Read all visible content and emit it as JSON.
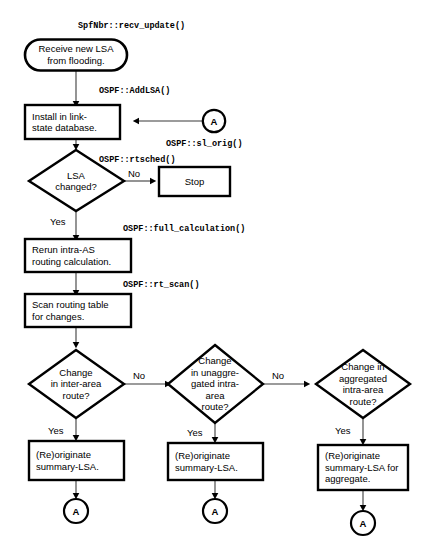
{
  "diagram": {
    "colors": {
      "shape_stroke": "#000000",
      "shape_fill": "#ffffff",
      "connector_line": "#7a7a7a",
      "arrowhead": "#000000",
      "text": "#000000",
      "background": "#ffffff"
    },
    "nodes": {
      "receive_lsa": {
        "shape": "terminator",
        "label": "Receive new LSA\nfrom flooding."
      },
      "install_db": {
        "shape": "process",
        "label": "Install in link-\nstate database."
      },
      "connector_a_top": {
        "shape": "connector",
        "label": "A"
      },
      "lsa_changed": {
        "shape": "decision",
        "label": "LSA\nchanged?"
      },
      "stop": {
        "shape": "process",
        "label": "Stop"
      },
      "rerun_intra_as": {
        "shape": "process",
        "label": "Rerun intra-AS\nrouting calculation."
      },
      "scan_routing_table": {
        "shape": "process",
        "label": "Scan routing table\nfor changes."
      },
      "change_inter_area": {
        "shape": "decision",
        "label": "Change\nin inter-area\nroute?"
      },
      "change_unaggregated": {
        "shape": "decision",
        "label": "Change\nin unaggre-\ngated intra-\narea\nroute?"
      },
      "change_aggregated": {
        "shape": "decision",
        "label": "Change in\naggregated\nintra-area\nroute?"
      },
      "reoriginate_1": {
        "shape": "process",
        "label": "(Re)originate\nsummary-LSA."
      },
      "reoriginate_2": {
        "shape": "process",
        "label": "(Re)originate\nsummary-LSA."
      },
      "reoriginate_3": {
        "shape": "process",
        "label": "(Re)originate\nsummary-LSA for\naggregate."
      },
      "connector_a_1": {
        "shape": "connector",
        "label": "A"
      },
      "connector_a_2": {
        "shape": "connector",
        "label": "A"
      },
      "connector_a_3": {
        "shape": "connector",
        "label": "A"
      }
    },
    "code_labels": {
      "recv_update": "SpfNbr::recv_update()",
      "add_lsa": "OSPF::AddLSA()",
      "sl_orig": "OSPF::sl_orig()",
      "rtsched": "OSPF::rtsched()",
      "full_calculation": "OSPF::full_calculation()",
      "rt_scan": "OSPF::rt_scan()"
    },
    "edge_labels": {
      "lsa_changed_no": "No",
      "lsa_changed_yes": "Yes",
      "inter_area_no": "No",
      "inter_area_yes": "Yes",
      "unaggregated_no": "No",
      "unaggregated_yes": "Yes",
      "aggregated_yes": "Yes"
    }
  }
}
